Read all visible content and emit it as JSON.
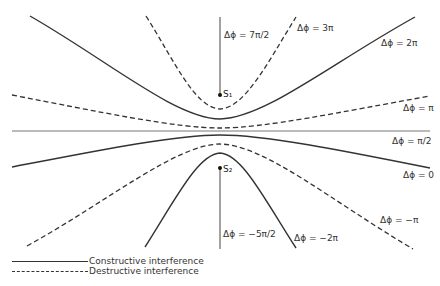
{
  "figure": {
    "sources": [
      {
        "id": "S1",
        "label": "S₁"
      },
      {
        "id": "S2",
        "label": "S₂"
      }
    ],
    "curve_labels": {
      "phi_7pi_2": "Δϕ = 7π/2",
      "phi_3pi": "Δϕ = 3π",
      "phi_2pi": "Δϕ = 2π",
      "phi_pi": "Δϕ = π",
      "phi_pi_2": "Δϕ = π/2",
      "phi_0": "Δϕ = 0",
      "phi_neg_pi": "Δϕ = −π",
      "phi_neg_5pi_2": "Δϕ = −5π/2",
      "phi_neg_2pi": "Δϕ = −2π"
    },
    "legend": {
      "constructive": "Constructive interference",
      "destructive": "Destructive interference"
    },
    "colors": {
      "line": "#333333",
      "axis_line": "#555555",
      "background": "#ffffff"
    }
  }
}
